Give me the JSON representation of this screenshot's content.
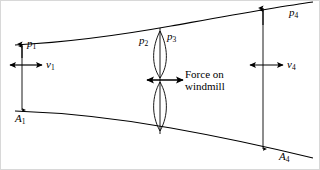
{
  "figure": {
    "background_color": "#ffffff",
    "stroke_color": "#000000"
  },
  "labels": {
    "p1": "p",
    "p1_sub": "1",
    "v1": "v",
    "v1_sub": "1",
    "A1": "A",
    "A1_sub": "1",
    "p2": "p",
    "p2_sub": "2",
    "p3": "p",
    "p3_sub": "3",
    "p4": "p",
    "p4_sub": "4",
    "v4": "v",
    "v4_sub": "4",
    "A4": "A",
    "A4_sub": "4",
    "force_line1": "Force on",
    "force_line2": "windmill"
  },
  "geometry": {
    "upper_curve": "M 14,44 C 90,40 150,30 200,20 C 240,12 280,5 312,1",
    "lower_curve": "M 14,110 C 90,112 150,120 200,130 C 240,138 280,148 312,156",
    "rotor_axis_x": 159,
    "rotor_top_y": 27,
    "rotor_bottom_y": 131,
    "rotor_hub_y": 79,
    "left_station_x": 21,
    "right_station_x": 262
  }
}
